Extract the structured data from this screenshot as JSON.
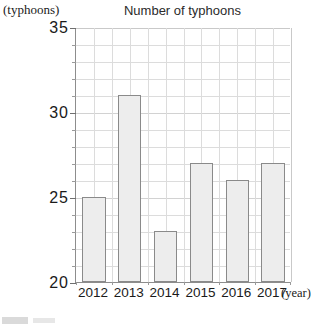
{
  "chart_data": {
    "type": "bar",
    "title": "Number of typhoons",
    "xlabel": "(year)",
    "ylabel": "(typhoons)",
    "categories": [
      "2012",
      "2013",
      "2014",
      "2015",
      "2016",
      "2017"
    ],
    "values": [
      25,
      31,
      23,
      27,
      26,
      27
    ],
    "ylim": [
      20,
      35
    ],
    "y_major_ticks": [
      20,
      25,
      30,
      35
    ],
    "y_minor_step": 1,
    "grid": true,
    "legend": "none",
    "bar_fill_color": "#ededed",
    "bar_border_color": "#8a8a8a",
    "grid_color": "#dcdcdc",
    "axis_color": "#8d8d8d"
  },
  "axis": {
    "y_tick_labels": [
      "20",
      "25",
      "30",
      "35"
    ],
    "x_tick_labels": [
      "2012",
      "2013",
      "2014",
      "2015",
      "2016",
      "2017"
    ]
  }
}
